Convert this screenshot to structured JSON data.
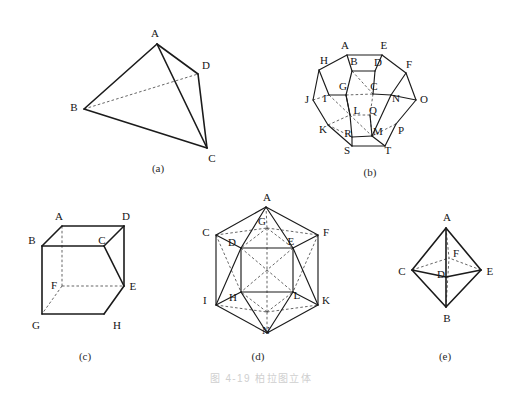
{
  "figure": {
    "caption": "图 4-19  柏拉图立体",
    "caption_number": "4-19",
    "caption_title": "柏拉图立体",
    "background_color": "#ffffff",
    "line_color": "#1b1b1b",
    "hidden_line_color": "#4a4a4a",
    "caption_color": "#cfcfcf",
    "width": 522,
    "height": 402
  },
  "subfigures": [
    {
      "key": "a",
      "label": "(a)",
      "name": "tetrahedron",
      "label_x": 158,
      "label_y": 168,
      "vertices": [
        {
          "id": "A",
          "lx": 155,
          "ly": 33
        },
        {
          "id": "B",
          "lx": 74,
          "ly": 107
        },
        {
          "id": "C",
          "lx": 212,
          "ly": 158
        },
        {
          "id": "D",
          "lx": 206,
          "ly": 65
        }
      ]
    },
    {
      "key": "b",
      "label": "(b)",
      "name": "dodecahedron",
      "label_x": 370,
      "label_y": 172,
      "vertices": [
        {
          "id": "A",
          "lx": 345,
          "ly": 45
        },
        {
          "id": "B",
          "lx": 354,
          "ly": 61
        },
        {
          "id": "C",
          "lx": 374,
          "ly": 86
        },
        {
          "id": "D",
          "lx": 378,
          "ly": 62
        },
        {
          "id": "E",
          "lx": 384,
          "ly": 45
        },
        {
          "id": "F",
          "lx": 409,
          "ly": 64
        },
        {
          "id": "G",
          "lx": 343,
          "ly": 86
        },
        {
          "id": "H",
          "lx": 324,
          "ly": 60
        },
        {
          "id": "I",
          "lx": 325,
          "ly": 98
        },
        {
          "id": "J",
          "lx": 307,
          "ly": 99
        },
        {
          "id": "K",
          "lx": 323,
          "ly": 129
        },
        {
          "id": "L",
          "lx": 357,
          "ly": 110
        },
        {
          "id": "M",
          "lx": 378,
          "ly": 131
        },
        {
          "id": "N",
          "lx": 396,
          "ly": 98
        },
        {
          "id": "O",
          "lx": 424,
          "ly": 99
        },
        {
          "id": "P",
          "lx": 401,
          "ly": 130
        },
        {
          "id": "Q",
          "lx": 373,
          "ly": 110
        },
        {
          "id": "R",
          "lx": 348,
          "ly": 133
        },
        {
          "id": "S",
          "lx": 347,
          "ly": 150
        },
        {
          "id": "T",
          "lx": 388,
          "ly": 150
        }
      ]
    },
    {
      "key": "c",
      "label": "(c)",
      "name": "cube",
      "label_x": 85,
      "label_y": 356,
      "vertices": [
        {
          "id": "A",
          "lx": 59,
          "ly": 216
        },
        {
          "id": "B",
          "lx": 32,
          "ly": 240
        },
        {
          "id": "C",
          "lx": 102,
          "ly": 240
        },
        {
          "id": "D",
          "lx": 126,
          "ly": 216
        },
        {
          "id": "E",
          "lx": 133,
          "ly": 286
        },
        {
          "id": "F",
          "lx": 54,
          "ly": 285
        },
        {
          "id": "G",
          "lx": 36,
          "ly": 325
        },
        {
          "id": "H",
          "lx": 117,
          "ly": 325
        }
      ]
    },
    {
      "key": "d",
      "label": "(d)",
      "name": "icosahedron",
      "label_x": 258,
      "label_y": 356,
      "vertices": [
        {
          "id": "A",
          "lx": 267,
          "ly": 197
        },
        {
          "id": "C",
          "lx": 206,
          "ly": 232
        },
        {
          "id": "D",
          "lx": 232,
          "ly": 242
        },
        {
          "id": "E",
          "lx": 291,
          "ly": 241
        },
        {
          "id": "F",
          "lx": 326,
          "ly": 232
        },
        {
          "id": "G",
          "lx": 262,
          "ly": 221
        },
        {
          "id": "H",
          "lx": 233,
          "ly": 297
        },
        {
          "id": "I",
          "lx": 205,
          "ly": 300
        },
        {
          "id": "K",
          "lx": 326,
          "ly": 300
        },
        {
          "id": "L",
          "lx": 297,
          "ly": 295
        },
        {
          "id": "N",
          "lx": 266,
          "ly": 330
        }
      ]
    },
    {
      "key": "e",
      "label": "(e)",
      "name": "octahedron",
      "label_x": 445,
      "label_y": 356,
      "vertices": [
        {
          "id": "A",
          "lx": 447,
          "ly": 217
        },
        {
          "id": "B",
          "lx": 447,
          "ly": 318
        },
        {
          "id": "C",
          "lx": 402,
          "ly": 271
        },
        {
          "id": "D",
          "lx": 441,
          "ly": 274
        },
        {
          "id": "E",
          "lx": 490,
          "ly": 271
        },
        {
          "id": "F",
          "lx": 456,
          "ly": 253
        }
      ]
    }
  ],
  "geometry": {
    "tetrahedron": {
      "points": {
        "A": [
          157,
          44
        ],
        "B": [
          84,
          109
        ],
        "C": [
          207,
          148
        ],
        "D": [
          198,
          74
        ]
      },
      "solid_edges": [
        [
          "A",
          "B"
        ],
        [
          "A",
          "C"
        ],
        [
          "A",
          "D"
        ],
        [
          "B",
          "C"
        ],
        [
          "D",
          "C"
        ]
      ],
      "hidden_edges": [
        [
          "B",
          "D"
        ]
      ]
    },
    "dodecahedron": {
      "points": {
        "A": [
          347,
          55
        ],
        "E": [
          382,
          55
        ],
        "H": [
          319,
          70
        ],
        "F": [
          406,
          73
        ],
        "B": [
          352,
          71
        ],
        "D": [
          375,
          71
        ],
        "G": [
          346,
          95
        ],
        "C": [
          373,
          94
        ],
        "I": [
          329,
          95
        ],
        "N": [
          391,
          95
        ],
        "J": [
          313,
          100
        ],
        "O": [
          416,
          100
        ],
        "L": [
          350,
          115
        ],
        "Q": [
          370,
          115
        ],
        "K": [
          328,
          125
        ],
        "P": [
          396,
          124
        ],
        "R": [
          352,
          137
        ],
        "M": [
          372,
          136
        ],
        "S": [
          352,
          146
        ],
        "T": [
          385,
          146
        ]
      },
      "solid_edges": [
        [
          "A",
          "E"
        ],
        [
          "A",
          "H"
        ],
        [
          "E",
          "F"
        ],
        [
          "H",
          "J"
        ],
        [
          "F",
          "O"
        ],
        [
          "J",
          "K"
        ],
        [
          "O",
          "P"
        ],
        [
          "K",
          "S"
        ],
        [
          "P",
          "T"
        ],
        [
          "S",
          "T"
        ],
        [
          "A",
          "B"
        ],
        [
          "E",
          "D"
        ],
        [
          "B",
          "G"
        ],
        [
          "D",
          "C"
        ],
        [
          "B",
          "D"
        ],
        [
          "G",
          "L"
        ],
        [
          "L",
          "R"
        ],
        [
          "R",
          "S"
        ],
        [
          "R",
          "M"
        ],
        [
          "M",
          "T"
        ],
        [
          "M",
          "Q"
        ],
        [
          "H",
          "I"
        ],
        [
          "I",
          "G"
        ],
        [
          "F",
          "N"
        ],
        [
          "N",
          "C"
        ],
        [
          "N",
          "O"
        ],
        [
          "N",
          "M"
        ],
        [
          "L",
          "G"
        ]
      ],
      "hidden_edges": [
        [
          "I",
          "J"
        ],
        [
          "I",
          "L"
        ],
        [
          "G",
          "C"
        ],
        [
          "C",
          "Q"
        ],
        [
          "Q",
          "L"
        ],
        [
          "Q",
          "M"
        ],
        [
          "K",
          "R"
        ],
        [
          "P",
          "M"
        ],
        [
          "B",
          "C"
        ],
        [
          "K",
          "L"
        ],
        [
          "L",
          "M"
        ]
      ]
    },
    "cube": {
      "points": {
        "A": [
          62,
          226
        ],
        "D": [
          124,
          226
        ],
        "B": [
          42,
          246
        ],
        "C": [
          104,
          246
        ],
        "F": [
          62,
          286
        ],
        "E": [
          124,
          286
        ],
        "G": [
          42,
          314
        ],
        "H": [
          104,
          314
        ]
      },
      "solid_edges": [
        [
          "B",
          "C"
        ],
        [
          "C",
          "E"
        ],
        [
          "E",
          "H"
        ],
        [
          "H",
          "G"
        ],
        [
          "G",
          "B"
        ],
        [
          "A",
          "D"
        ],
        [
          "D",
          "C"
        ],
        [
          "D",
          "E"
        ],
        [
          "A",
          "B"
        ]
      ],
      "hidden_edges": [
        [
          "A",
          "F"
        ],
        [
          "F",
          "G"
        ],
        [
          "F",
          "E"
        ]
      ]
    },
    "icosahedron": {
      "points": {
        "A": [
          266,
          207
        ],
        "C": [
          216,
          235
        ],
        "F": [
          318,
          235
        ],
        "I": [
          216,
          305
        ],
        "K": [
          318,
          305
        ],
        "N": [
          267,
          333
        ],
        "D": [
          241,
          248
        ],
        "E": [
          293,
          248
        ],
        "H": [
          241,
          292
        ],
        "L": [
          293,
          292
        ],
        "G": [
          267,
          228
        ],
        "M": [
          267,
          312
        ]
      },
      "solid_edges": [
        [
          "A",
          "C"
        ],
        [
          "C",
          "I"
        ],
        [
          "I",
          "N"
        ],
        [
          "N",
          "K"
        ],
        [
          "K",
          "F"
        ],
        [
          "F",
          "A"
        ],
        [
          "A",
          "D"
        ],
        [
          "A",
          "E"
        ],
        [
          "D",
          "E"
        ],
        [
          "D",
          "I"
        ],
        [
          "E",
          "K"
        ],
        [
          "D",
          "H"
        ],
        [
          "E",
          "L"
        ],
        [
          "H",
          "L"
        ],
        [
          "H",
          "I"
        ],
        [
          "L",
          "K"
        ],
        [
          "H",
          "N"
        ],
        [
          "L",
          "N"
        ],
        [
          "C",
          "D"
        ],
        [
          "F",
          "E"
        ]
      ],
      "hidden_edges": [
        [
          "C",
          "G"
        ],
        [
          "G",
          "F"
        ],
        [
          "G",
          "A"
        ],
        [
          "G",
          "D"
        ],
        [
          "G",
          "E"
        ],
        [
          "C",
          "H"
        ],
        [
          "F",
          "L"
        ],
        [
          "I",
          "M"
        ],
        [
          "M",
          "K"
        ],
        [
          "M",
          "H"
        ],
        [
          "M",
          "L"
        ],
        [
          "M",
          "N"
        ],
        [
          "G",
          "M"
        ],
        [
          "D",
          "L"
        ],
        [
          "E",
          "H"
        ]
      ]
    },
    "octahedron": {
      "points": {
        "A": [
          446,
          228
        ],
        "B": [
          446,
          307
        ],
        "C": [
          412,
          270
        ],
        "E": [
          481,
          270
        ],
        "D": [
          446,
          277
        ],
        "F": [
          449,
          258
        ]
      },
      "solid_edges": [
        [
          "A",
          "C"
        ],
        [
          "A",
          "E"
        ],
        [
          "B",
          "C"
        ],
        [
          "B",
          "E"
        ],
        [
          "A",
          "D"
        ],
        [
          "C",
          "D"
        ],
        [
          "D",
          "E"
        ],
        [
          "D",
          "B"
        ]
      ],
      "hidden_edges": [
        [
          "A",
          "F"
        ],
        [
          "C",
          "F"
        ],
        [
          "E",
          "F"
        ],
        [
          "B",
          "F"
        ]
      ]
    }
  }
}
